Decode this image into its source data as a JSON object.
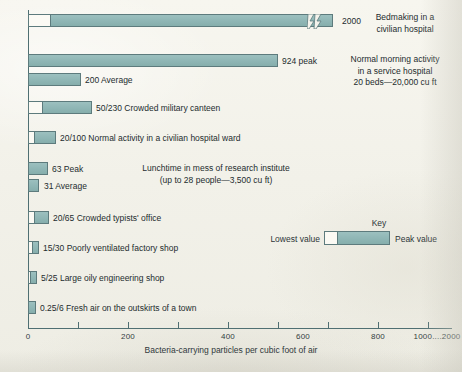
{
  "chart_data": {
    "type": "bar",
    "orientation": "horizontal",
    "title": "",
    "xlabel": "Bacteria-carrying particles per cubic foot of air",
    "ylabel": "",
    "xlim": [
      0,
      2000
    ],
    "grid": false,
    "axis_note": "Linear to 1000, then compressed to 2000 with a scale break on the top bar",
    "tick_labels": [
      "0",
      "200",
      "400",
      "600",
      "800",
      "1000",
      "....",
      "2000"
    ],
    "ticks": [
      0,
      200,
      400,
      600,
      800,
      1000,
      2000
    ],
    "legend": {
      "title": "Key",
      "low_label": "Lowest value",
      "peak_label": "Peak value",
      "position": "center-right"
    },
    "colors": {
      "peak_fill": "#93b9b8",
      "low_fill": "#fbfaf4",
      "outline": "#5d7b7d",
      "background": "#f4f3ec",
      "axis": "#4f6f72",
      "text": "#232c2e"
    },
    "series": [
      {
        "name": "Bedmaking in a civilian hospital",
        "low": 50,
        "peak": 2000,
        "value_label": "2000",
        "note": "Bedmaking in a\ncivilian hospital",
        "has_break": true
      },
      {
        "name": "Normal morning activity in a service hospital (peak)",
        "low": 0,
        "peak": 924,
        "value_label": "924 peak",
        "note": "Normal morning activity\nin a service hospital\n20 beds—20,000 cu ft",
        "has_break": false
      },
      {
        "name": "Normal morning activity in a service hospital (average)",
        "low": 0,
        "peak": 200,
        "value_label": "200 Average",
        "note": "",
        "has_break": false
      },
      {
        "name": "Crowded military canteen",
        "low": 50,
        "peak": 230,
        "value_label": "50/230  Crowded military canteen",
        "note": "",
        "has_break": false
      },
      {
        "name": "Normal activity in a civilian hospital ward",
        "low": 20,
        "peak": 100,
        "value_label": "20/100  Normal activity in a civilian hospital ward",
        "note": "",
        "has_break": false
      },
      {
        "name": "Lunchtime in mess of research institute (peak)",
        "low": 0,
        "peak": 63,
        "value_label": "63 Peak",
        "note": "Lunchtime in mess of research institute\n(up to 28 people—3,500 cu ft)",
        "has_break": false
      },
      {
        "name": "Lunchtime in mess of research institute (average)",
        "low": 0,
        "peak": 31,
        "value_label": "31 Average",
        "note": "",
        "has_break": false
      },
      {
        "name": "Crowded typists' office",
        "low": 20,
        "peak": 65,
        "value_label": "20/65  Crowded typists' office",
        "note": "",
        "has_break": false
      },
      {
        "name": "Poorly ventilated factory shop",
        "low": 15,
        "peak": 30,
        "value_label": "15/30  Poorly ventilated factory shop",
        "note": "",
        "has_break": false
      },
      {
        "name": "Large oily engineering shop",
        "low": 5,
        "peak": 25,
        "value_label": "5/25  Large oily engineering shop",
        "note": "",
        "has_break": false
      },
      {
        "name": "Fresh air on the outskirts of a town",
        "low": 0.25,
        "peak": 6,
        "value_label": "0.25/6  Fresh air on the outskirts of a town",
        "note": "",
        "has_break": false
      }
    ]
  },
  "axis": {
    "title": "Bacteria-carrying particles per cubic foot of air",
    "labels": [
      {
        "text": "0",
        "x": 28
      },
      {
        "text": "200",
        "x": 128
      },
      {
        "text": "400",
        "x": 228
      },
      {
        "text": "600",
        "x": 303
      },
      {
        "text": "800",
        "x": 378
      },
      {
        "text": "1000....2000",
        "x": 437
      }
    ]
  },
  "bars": [
    {
      "top": 14,
      "left": 28,
      "low_w": 22,
      "total_w": 305,
      "label": "2000",
      "label_x": 342,
      "solid": false,
      "break_x": 278
    },
    {
      "top": 54,
      "left": 28,
      "low_w": 0,
      "total_w": 250,
      "label": "924 peak",
      "label_x": 282,
      "solid": true,
      "break_x": null
    },
    {
      "top": 73,
      "left": 28,
      "low_w": 0,
      "total_w": 53,
      "label": "200 Average",
      "label_x": 85,
      "solid": true,
      "break_x": null
    },
    {
      "top": 101,
      "left": 28,
      "low_w": 14,
      "total_w": 64,
      "label": "50/230  Crowded military canteen",
      "label_x": 96,
      "solid": false,
      "break_x": null
    },
    {
      "top": 131,
      "left": 28,
      "low_w": 6,
      "total_w": 28,
      "label": "20/100  Normal activity in a civilian hospital ward",
      "label_x": 60,
      "solid": false,
      "break_x": null
    },
    {
      "top": 162,
      "left": 28,
      "low_w": 0,
      "total_w": 20,
      "label": "63 Peak",
      "label_x": 52,
      "solid": true,
      "break_x": null
    },
    {
      "top": 179,
      "left": 28,
      "low_w": 0,
      "total_w": 11,
      "label": "31 Average",
      "label_x": 44,
      "solid": true,
      "break_x": null
    },
    {
      "top": 211,
      "left": 28,
      "low_w": 6,
      "total_w": 21,
      "label": "20/65  Crowded typists' office",
      "label_x": 53,
      "solid": false,
      "break_x": null
    },
    {
      "top": 241,
      "left": 28,
      "low_w": 4,
      "total_w": 11,
      "label": "15/30  Poorly ventilated factory shop",
      "label_x": 43,
      "solid": false,
      "break_x": null
    },
    {
      "top": 271,
      "left": 28,
      "low_w": 2,
      "total_w": 9,
      "label": "5/25  Large oily engineering shop",
      "label_x": 41,
      "solid": false,
      "break_x": null
    },
    {
      "top": 301,
      "left": 28,
      "low_w": 0,
      "total_w": 8,
      "label": "0.25/6  Fresh air on the outskirts of a town",
      "label_x": 40,
      "solid": true,
      "break_x": null
    }
  ],
  "notes": [
    {
      "id": "note-bedmaking",
      "left": 350,
      "top": 12,
      "width": 110,
      "lines": [
        "Bedmaking in a",
        "civilian hospital"
      ],
      "align": "center"
    },
    {
      "id": "note-service-hospital",
      "left": 332,
      "top": 54,
      "width": 126,
      "lines": [
        "Normal morning activity",
        "in a service hospital",
        "20 beds—20,000 cu ft"
      ],
      "align": "center"
    },
    {
      "id": "note-lunchtime",
      "left": 112,
      "top": 163,
      "width": 208,
      "lines": [
        "Lunchtime in mess of research institute",
        "(up to 28 people—3,500 cu ft)"
      ],
      "align": "center"
    }
  ],
  "key": {
    "title": "Key",
    "low_label": "Lowest value",
    "peak_label": "Peak value"
  }
}
